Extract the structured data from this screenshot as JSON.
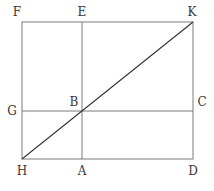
{
  "diagram": {
    "type": "geometric-figure",
    "colors": {
      "line": "#7a7a7a",
      "diagonal": "#333333",
      "label": "#3a3a3a",
      "background": "#ffffff"
    },
    "points": {
      "F": {
        "label": "F",
        "x": 22,
        "y": 22
      },
      "E": {
        "label": "E",
        "x": 82,
        "y": 22
      },
      "K": {
        "label": "K",
        "x": 193,
        "y": 22
      },
      "G": {
        "label": "G",
        "x": 22,
        "y": 111
      },
      "B": {
        "label": "B",
        "x": 82,
        "y": 111
      },
      "C": {
        "label": "C",
        "x": 193,
        "y": 111
      },
      "H": {
        "label": "H",
        "x": 22,
        "y": 159
      },
      "A": {
        "label": "A",
        "x": 82,
        "y": 159
      },
      "D": {
        "label": "D",
        "x": 193,
        "y": 159
      }
    },
    "segments": [
      {
        "name": "FK",
        "from": "F",
        "to": "K"
      },
      {
        "name": "KD",
        "from": "K",
        "to": "D"
      },
      {
        "name": "DH",
        "from": "D",
        "to": "H"
      },
      {
        "name": "HF",
        "from": "H",
        "to": "F"
      },
      {
        "name": "EA",
        "from": "E",
        "to": "A"
      },
      {
        "name": "GC",
        "from": "G",
        "to": "C"
      },
      {
        "name": "HK",
        "from": "H",
        "to": "K"
      }
    ]
  }
}
